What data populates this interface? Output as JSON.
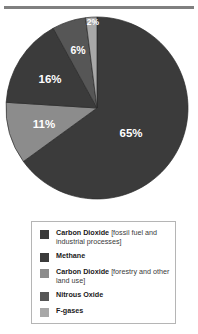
{
  "chart_data": {
    "type": "pie",
    "title": "",
    "subtitle": "",
    "xlabel": "",
    "ylabel": "",
    "legend_position": "bottom",
    "grid": false,
    "units": "percent",
    "start_angle_deg": 0,
    "direction": "clockwise",
    "categories": [
      "Carbon Dioxide [fossil fuel and industrial processes]",
      "Carbon Dioxide [forestry and other land use]",
      "Methane",
      "Nitrous Oxide",
      "F-gases"
    ],
    "values": [
      65,
      11,
      16,
      6,
      2
    ],
    "slices": [
      {
        "label": "Carbon Dioxide [fossil fuel and industrial processes]",
        "value": 65,
        "data_label": "65%",
        "color": "#3b3b3b",
        "label_x": 131,
        "label_y": 134
      },
      {
        "label": "Carbon Dioxide [forestry and other land use]",
        "value": 11,
        "data_label": "11%",
        "color": "#8c8c8c",
        "label_x": 44,
        "label_y": 125
      },
      {
        "label": "Methane",
        "value": 16,
        "data_label": "16%",
        "color": "#3b3b3b",
        "label_x": 50,
        "label_y": 80
      },
      {
        "label": "Nitrous Oxide",
        "value": 6,
        "data_label": "6%",
        "color": "#565656",
        "label_x": 78,
        "label_y": 51
      },
      {
        "label": "F-gases",
        "value": 2,
        "data_label": "2%",
        "color": "#a8a8a8",
        "label_x": 93,
        "label_y": 23
      }
    ]
  },
  "legend": {
    "items": [
      {
        "swatch_name": "legend-swatch-co2-fossil",
        "color": "#3b3b3b",
        "bold_text": "Carbon Dioxide ",
        "regular_text": "[fossil fuel and industrial processes]"
      },
      {
        "swatch_name": "legend-swatch-methane",
        "color": "#3b3b3b",
        "bold_text": "Methane",
        "regular_text": ""
      },
      {
        "swatch_name": "legend-swatch-co2-forestry",
        "color": "#8c8c8c",
        "bold_text": "Carbon Dioxide ",
        "regular_text": "[forestry and other land use]"
      },
      {
        "swatch_name": "legend-swatch-nitrous-oxide",
        "color": "#565656",
        "bold_text": "Nitrous Oxide",
        "regular_text": ""
      },
      {
        "swatch_name": "legend-swatch-f-gases",
        "color": "#a8a8a8",
        "bold_text": "F-gases",
        "regular_text": ""
      }
    ]
  },
  "style": {
    "rule_color": "#808080",
    "legend_border_color": "#b5b5b5",
    "background": "#ffffff",
    "label_text_color": "#ffffff"
  }
}
